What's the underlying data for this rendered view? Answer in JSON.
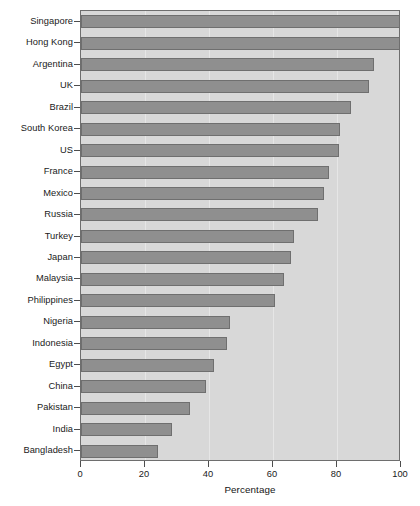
{
  "chart_data": {
    "type": "bar",
    "orientation": "horizontal",
    "title": "",
    "xlabel": "Percentage",
    "ylabel": "",
    "xlim": [
      0,
      100
    ],
    "xticks": [
      0,
      20,
      40,
      60,
      80,
      100
    ],
    "grid": true,
    "legend": false,
    "categories": [
      "Singapore",
      "Hong Kong",
      "Argentina",
      "UK",
      "Brazil",
      "South Korea",
      "US",
      "France",
      "Mexico",
      "Russia",
      "Turkey",
      "Japan",
      "Malaysia",
      "Philippines",
      "Nigeria",
      "Indonesia",
      "Egypt",
      "China",
      "Pakistan",
      "India",
      "Bangladesh"
    ],
    "values": [
      100,
      100,
      91.5,
      90,
      84.5,
      81,
      80.5,
      77.5,
      76,
      74,
      66.5,
      65.5,
      63.5,
      60.5,
      46.5,
      45.5,
      41.5,
      39,
      34,
      28.5,
      24
    ],
    "bar_color": "#8f8f8f",
    "bar_edge_color": "#6f6f6f",
    "panel_color": "#d8d8d8",
    "axis_color": "#4d4d4d",
    "text_color": "#1a1a1a"
  }
}
